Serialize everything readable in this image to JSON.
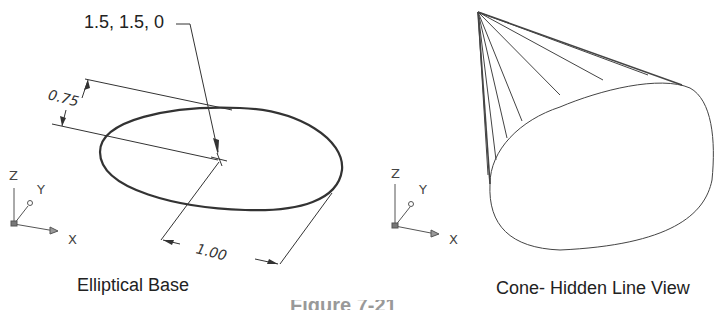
{
  "left_panel": {
    "title": "Elliptical Base",
    "leader_label": "1.5, 1.5, 0",
    "dim_minor": "0.75",
    "dim_major": "1.00",
    "ucs": {
      "z": "Z",
      "y": "Y",
      "x": "X"
    }
  },
  "right_panel": {
    "title": "Cone- Hidden Line View",
    "ucs": {
      "z": "Z",
      "y": "Y",
      "x": "X"
    }
  },
  "figure_caption_partial": "Figure 7-21"
}
